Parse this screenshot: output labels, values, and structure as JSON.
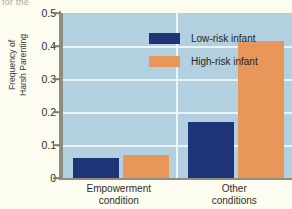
{
  "caption_fragment": "for the",
  "chart_data": {
    "type": "bar",
    "title": "",
    "xlabel": "",
    "ylabel_lines": [
      "Frequency of",
      "Harsh Parenting"
    ],
    "categories": [
      "Empowerment condition",
      "Other conditions"
    ],
    "category_lines": [
      [
        "Empowerment",
        "condition"
      ],
      [
        "Other",
        "conditions"
      ]
    ],
    "series": [
      {
        "name": "Low-risk infant",
        "color": "#1e3477",
        "values": [
          0.06,
          0.17
        ]
      },
      {
        "name": "High-risk infant",
        "color": "#e8965a",
        "values": [
          0.07,
          0.415
        ]
      }
    ],
    "ylim": [
      0,
      0.5
    ],
    "yticks": [
      0.5,
      0.4,
      0.3,
      0.2,
      0.1,
      0
    ],
    "ytick_labels": [
      "0.5",
      "0.4",
      "0.3",
      "0.2",
      "0.1",
      "0"
    ],
    "grid": true,
    "grid_color": "#eef4f7",
    "plot_background": "#b3d0e0",
    "legend_position": "inside-top-left",
    "legend": [
      {
        "label": "Low-risk infant",
        "color": "#1e3477"
      },
      {
        "label": "High-risk infant",
        "color": "#e8965a"
      }
    ]
  }
}
